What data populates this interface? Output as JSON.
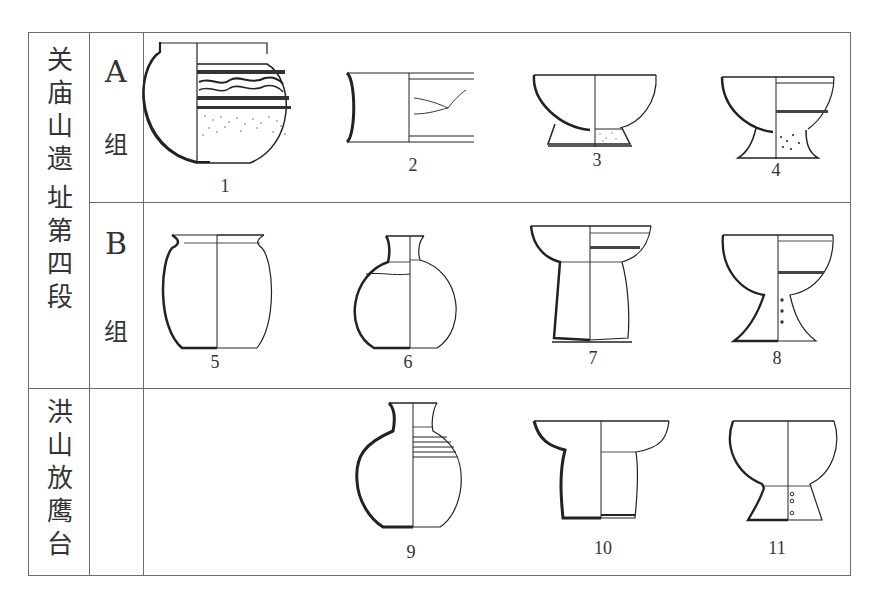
{
  "figure": {
    "site_1": {
      "label": "关庙山遗址第四段",
      "chars": [
        "关",
        "庙",
        "山",
        "遗",
        "址",
        "第",
        "四",
        "段"
      ],
      "groups": [
        {
          "letter": "A",
          "suffix": "组",
          "items": [
            "1",
            "2",
            "3",
            "4"
          ]
        },
        {
          "letter": "B",
          "suffix": "组",
          "items": [
            "5",
            "6",
            "7",
            "8"
          ]
        }
      ]
    },
    "site_2": {
      "label": "洪山放鹰台",
      "chars": [
        "洪",
        "山",
        "放",
        "鹰",
        "台"
      ],
      "items": [
        "9",
        "10",
        "11"
      ]
    },
    "artifacts": [
      {
        "number": "1",
        "type": "painted jar"
      },
      {
        "number": "2",
        "type": "cylinder vessel"
      },
      {
        "number": "3",
        "type": "ring-foot bowl"
      },
      {
        "number": "4",
        "type": "dou (stemmed bowl)"
      },
      {
        "number": "5",
        "type": "jar"
      },
      {
        "number": "6",
        "type": "flask-neck pot"
      },
      {
        "number": "7",
        "type": "stand"
      },
      {
        "number": "8",
        "type": "dou with perforated stem"
      },
      {
        "number": "9",
        "type": "pot"
      },
      {
        "number": "10",
        "type": "stand"
      },
      {
        "number": "11",
        "type": "dou with perforated stem"
      }
    ]
  }
}
